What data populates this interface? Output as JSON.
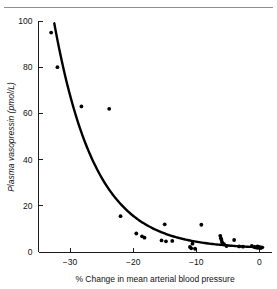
{
  "figure": {
    "has_top_rule": true,
    "background_color": "#ffffff",
    "ink_color": "#000000"
  },
  "chart_data": {
    "type": "scatter",
    "title": "",
    "subtitle": "",
    "xlabel": "% Change in mean arterial blood pressure",
    "ylabel": "Plasma vasopressin (pmol/L)",
    "xlim": [
      -35,
      2
    ],
    "ylim": [
      0,
      100
    ],
    "xticks": [
      -30,
      -20,
      -10,
      0
    ],
    "xtick_labels": [
      "−30",
      "−20",
      "−10",
      "0"
    ],
    "yticks": [
      0,
      20,
      40,
      60,
      80,
      100
    ],
    "ytick_labels": [
      "0",
      "20",
      "40",
      "60",
      "80",
      "100"
    ],
    "grid": false,
    "legend": "none",
    "series": [
      {
        "name": "Observations",
        "marker": "filled-circle",
        "marker_color": "#000000",
        "x": [
          -33.0,
          -32.0,
          -28.2,
          -23.8,
          -22.0,
          -19.5,
          -18.6,
          -18.2,
          -15.5,
          -15.0,
          -14.8,
          -13.8,
          -11.0,
          -10.8,
          -10.6,
          -10.2,
          -9.2,
          -6.2,
          -6.1,
          -6.0,
          -5.9,
          -5.6,
          -5.2,
          -4.0,
          -3.2,
          -2.6,
          -1.2,
          -0.8,
          -0.6,
          -0.4,
          -0.3,
          -0.2,
          0.0,
          0.2,
          0.4
        ],
        "y": [
          95.0,
          80.0,
          63.0,
          62.0,
          15.5,
          8.0,
          6.8,
          6.2,
          5.0,
          12.0,
          4.6,
          4.8,
          2.2,
          1.6,
          3.6,
          1.4,
          11.8,
          7.0,
          6.0,
          5.2,
          4.2,
          3.4,
          2.6,
          5.2,
          2.4,
          2.3,
          2.6,
          2.2,
          2.0,
          1.9,
          2.4,
          1.8,
          2.2,
          1.7,
          2.0
        ]
      }
    ],
    "fit_curve": {
      "name": "Exponential fit",
      "color": "#000000",
      "x_start": -32.5,
      "x_end": 0.6,
      "y_start": 99.0,
      "y_end": 2.0,
      "form": "exponential decay"
    }
  }
}
